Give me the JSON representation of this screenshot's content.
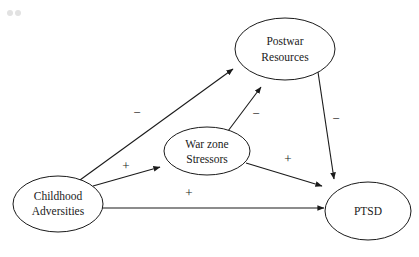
{
  "diagram": {
    "type": "path-diagram",
    "background_color": "#ffffff",
    "line_color": "#1a1a1a",
    "nodes": [
      {
        "id": "childhood-adversities",
        "label_line1": "Childhood",
        "label_line2": "Adversities",
        "cx": 58,
        "cy": 204,
        "rx": 45,
        "ry": 28
      },
      {
        "id": "war-zone-stressors",
        "label_line1": "War zone",
        "label_line2": "Stressors",
        "cx": 207,
        "cy": 151,
        "rx": 43,
        "ry": 24
      },
      {
        "id": "postwar-resources",
        "label_line1": "Postwar",
        "label_line2": "Resources",
        "cx": 285,
        "cy": 49,
        "rx": 50,
        "ry": 31
      },
      {
        "id": "ptsd",
        "label_line1": "PTSD",
        "label_line2": "",
        "cx": 368,
        "cy": 211,
        "rx": 43,
        "ry": 29
      }
    ],
    "edges": [
      {
        "id": "childhood-to-postwar",
        "from": "childhood-adversities",
        "to": "postwar-resources",
        "sign": "−",
        "sign_x": 137,
        "sign_y": 114,
        "x1": 80,
        "y1": 180,
        "x2": 233,
        "y2": 69
      },
      {
        "id": "childhood-to-warzone",
        "from": "childhood-adversities",
        "to": "war-zone-stressors",
        "sign": "+",
        "sign_x": 126,
        "sign_y": 167,
        "x1": 93,
        "y1": 186,
        "x2": 160,
        "y2": 167
      },
      {
        "id": "childhood-to-ptsd",
        "from": "childhood-adversities",
        "to": "ptsd",
        "sign": "+",
        "sign_x": 189,
        "sign_y": 194,
        "x1": 101,
        "y1": 208,
        "x2": 324,
        "y2": 208
      },
      {
        "id": "warzone-to-postwar",
        "from": "war-zone-stressors",
        "to": "postwar-resources",
        "sign": "−",
        "sign_x": 256,
        "sign_y": 115,
        "x1": 228,
        "y1": 131,
        "x2": 261,
        "y2": 87
      },
      {
        "id": "warzone-to-ptsd",
        "from": "war-zone-stressors",
        "to": "ptsd",
        "sign": "+",
        "sign_x": 288,
        "sign_y": 160,
        "x1": 246,
        "y1": 163,
        "x2": 322,
        "y2": 186
      },
      {
        "id": "postwar-to-ptsd",
        "from": "postwar-resources",
        "to": "ptsd",
        "sign": "−",
        "sign_x": 336,
        "sign_y": 120,
        "x1": 318,
        "y1": 72,
        "x2": 334,
        "y2": 179
      }
    ],
    "artifacts": [
      {
        "id": "corner-dot-1",
        "cx": 10,
        "cy": 13,
        "r": 3,
        "color": "#e2e2e2"
      },
      {
        "id": "corner-dot-2",
        "cx": 18,
        "cy": 13,
        "r": 3,
        "color": "#e2e2e2"
      }
    ]
  }
}
